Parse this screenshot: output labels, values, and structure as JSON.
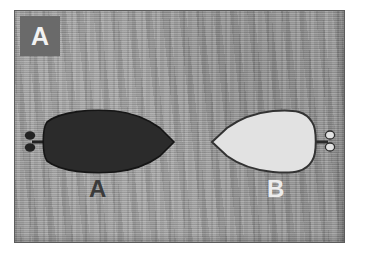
{
  "figure": {
    "panel_label": "A",
    "caption_objects": [
      {
        "id": "A",
        "label": "A",
        "fill_color": "#2b2b2b",
        "outline_color": "#1a1a1a",
        "label_color": "#3b3b3b",
        "nose_direction": "right",
        "propeller_side": "left"
      },
      {
        "id": "B",
        "label": "B",
        "fill_color": "#e2e2e2",
        "outline_color": "#3a3a3a",
        "label_color": "#ececec",
        "nose_direction": "left",
        "propeller_side": "right"
      }
    ],
    "background": {
      "description": "mottled gray horizontally-streaked sonar texture",
      "color": "#9b9b9b"
    },
    "border_color": "#5c5c5c",
    "badge_color": "#6a6a6a",
    "badge_text_color": "#f2f2f2"
  }
}
